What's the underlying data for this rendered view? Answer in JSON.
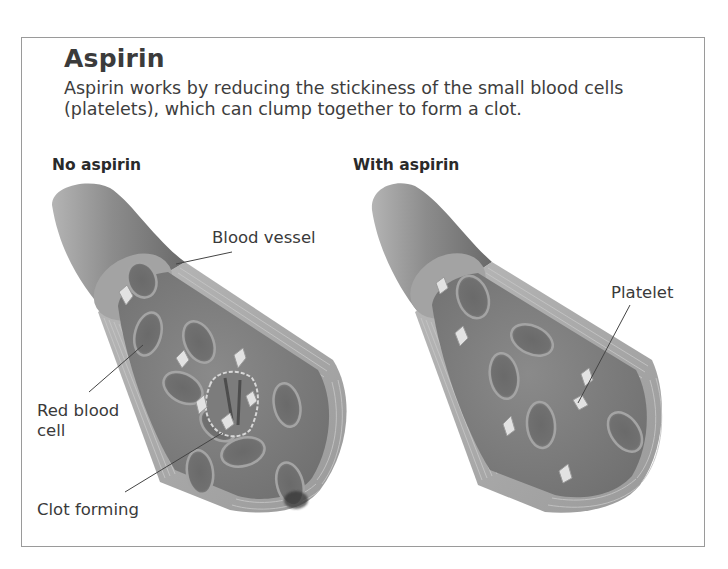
{
  "figure": {
    "title": "Aspirin",
    "description": "Aspirin works by reducing the stickiness of the small blood cells (platelets), which can clump together to form a clot.",
    "panels": [
      {
        "heading": "No aspirin",
        "labels": {
          "blood_vessel": "Blood vessel",
          "red_blood_cell_line1": "Red blood",
          "red_blood_cell_line2": "cell",
          "clot_forming": "Clot forming"
        }
      },
      {
        "heading": "With aspirin",
        "labels": {
          "platelet": "Platelet"
        }
      }
    ]
  },
  "colors": {
    "frame_border": "#9a9a9a",
    "vessel_outer": "#8e8e8e",
    "vessel_face": "#7a7a7a",
    "wall_stripes": "#a8a8a8",
    "red_blood_cell": "#6e6e6e",
    "platelet": "#e4e4e4",
    "text": "#3a3a3a"
  }
}
